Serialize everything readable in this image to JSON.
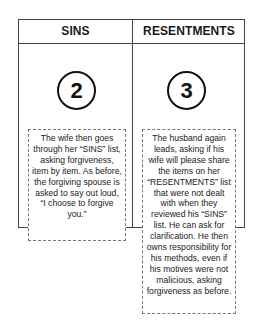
{
  "columns": [
    {
      "header": "SINS",
      "step_number": "2",
      "description": "The wife then goes through her “SINS” list, asking forgiveness, item by item.  As before, the forgiving spouse is asked to say out loud, “I choose to forgive you.”"
    },
    {
      "header": "RESENTMENTS",
      "step_number": "3",
      "description": "The husband again leads, asking if his wife will please share the items on her “RESENTMENTS” list that were not dealt with when they reviewed his “SINS” list.  He can ask for clarification.  He then owns responsibility for his methods, even if his motives were not malicious, asking forgiveness as before."
    }
  ],
  "colors": {
    "border": "#444444",
    "circle_stroke": "#111111",
    "note_border": "#777777",
    "background": "#ffffff"
  }
}
